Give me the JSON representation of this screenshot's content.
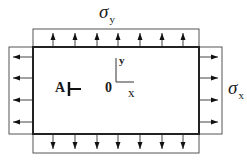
{
  "diagram": {
    "type": "plate under biaxial tension",
    "labels": {
      "sigma_y": {
        "symbol": "σ",
        "subscript": "y"
      },
      "sigma_x": {
        "symbol": "σ",
        "subscript": "x"
      },
      "point_a": "A",
      "origin": "0",
      "axis_x": "x",
      "axis_y": "y"
    },
    "plate": {
      "x": 33,
      "y": 47,
      "width": 166,
      "height": 87
    },
    "bands": {
      "top": {
        "x": 33,
        "y": 29,
        "width": 166,
        "height": 18,
        "arrow_dir": "up",
        "arrow_x": [
          53,
          75,
          97,
          118,
          140,
          162,
          183
        ]
      },
      "bottom": {
        "x": 33,
        "y": 134,
        "width": 166,
        "height": 19,
        "arrow_dir": "down",
        "arrow_x": [
          53,
          75,
          97,
          118,
          140,
          162,
          183
        ]
      },
      "left": {
        "x": 9,
        "y": 47,
        "width": 24,
        "height": 87,
        "arrow_dir": "left",
        "arrow_y": [
          57,
          78,
          100,
          122
        ]
      },
      "right": {
        "x": 199,
        "y": 47,
        "width": 23,
        "height": 87,
        "arrow_dir": "right",
        "arrow_y": [
          57,
          78,
          100,
          122
        ]
      }
    },
    "colors": {
      "line": "#222222",
      "thin": "#555555"
    }
  }
}
